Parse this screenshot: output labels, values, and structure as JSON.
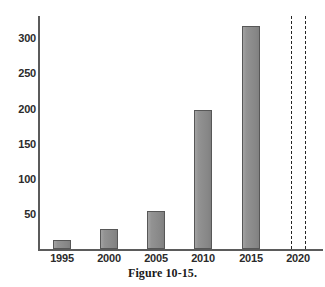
{
  "caption": "Figure 10-15.",
  "chart_data": {
    "type": "bar",
    "title": "",
    "subtitle": "",
    "xlabel": "",
    "ylabel": "",
    "categories": [
      "1995",
      "2000",
      "2005",
      "2010",
      "2015",
      "2020"
    ],
    "values": [
      13,
      28,
      55,
      198,
      317,
      null
    ],
    "series": [
      {
        "name": "",
        "values": [
          13,
          28,
          55,
          198,
          317,
          null
        ]
      }
    ],
    "xtick_labels": [
      "1995",
      "2000",
      "2005",
      "2010",
      "2015",
      "2020"
    ],
    "ytick_labels": [
      "50",
      "100",
      "150",
      "200",
      "250",
      "300"
    ],
    "ytick_values": [
      50,
      100,
      150,
      200,
      250,
      300
    ],
    "ylim": [
      0,
      330
    ],
    "grid": false,
    "legend": false,
    "legend_position": "none",
    "bar_color": "#8e8e8e",
    "bar_edge_color": "#575757",
    "axis_color": "#5b5b5b",
    "annotations": [
      {
        "name": "dashed-line-left",
        "type": "vertical-dashed-line",
        "x_position": 291,
        "color": "#262626"
      },
      {
        "name": "dashed-line-right",
        "type": "vertical-dashed-line",
        "x_position": 305,
        "color": "#262626"
      }
    ],
    "bar_pixel_layout": [
      {
        "label": "1995",
        "center_x": 62,
        "top_y": 240,
        "width": 18
      },
      {
        "label": "2000",
        "center_x": 109,
        "top_y": 229,
        "width": 18
      },
      {
        "label": "2005",
        "center_x": 156,
        "top_y": 211,
        "width": 18
      },
      {
        "label": "2010",
        "center_x": 203,
        "top_y": 110,
        "width": 18
      },
      {
        "label": "2015",
        "center_x": 251,
        "top_y": 26,
        "width": 18
      }
    ],
    "ytick_pixel_y": [
      214,
      179,
      144,
      109,
      73,
      38
    ],
    "xtick_pixel_x": [
      62,
      109,
      156,
      203,
      251,
      298
    ],
    "baseline_pixel_y": 249
  }
}
